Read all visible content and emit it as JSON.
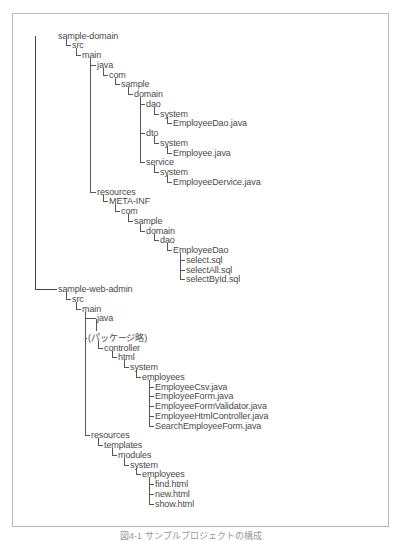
{
  "figure": {
    "caption": "図4-1 サンプルプロジェクトの構成",
    "row_height": 9.75,
    "top_y": 30.5
  },
  "tree": [
    {
      "label": "sample-domain",
      "x": 58,
      "row": 0
    },
    {
      "label": "src",
      "x": 72,
      "row": 1
    },
    {
      "label": "main",
      "x": 82,
      "row": 2
    },
    {
      "label": "java",
      "x": 97,
      "row": 3
    },
    {
      "label": "com",
      "x": 109,
      "row": 4
    },
    {
      "label": "sample",
      "x": 121,
      "row": 5
    },
    {
      "label": "domain",
      "x": 134,
      "row": 6
    },
    {
      "label": "dao",
      "x": 146,
      "row": 7
    },
    {
      "label": "system",
      "x": 160,
      "row": 8
    },
    {
      "label": "EmployeeDao.java",
      "x": 173,
      "row": 9
    },
    {
      "label": "dto",
      "x": 146,
      "row": 10
    },
    {
      "label": "system",
      "x": 160,
      "row": 11
    },
    {
      "label": "Employee.java",
      "x": 173,
      "row": 12
    },
    {
      "label": "service",
      "x": 146,
      "row": 13
    },
    {
      "label": "system",
      "x": 160,
      "row": 14
    },
    {
      "label": "EmployeeDervice.java",
      "x": 173,
      "row": 15
    },
    {
      "label": "resources",
      "x": 97,
      "row": 16
    },
    {
      "label": "META-INF",
      "x": 109,
      "row": 17
    },
    {
      "label": "com",
      "x": 121,
      "row": 18
    },
    {
      "label": "sample",
      "x": 134,
      "row": 19
    },
    {
      "label": "domain",
      "x": 146,
      "row": 20
    },
    {
      "label": "dao",
      "x": 160,
      "row": 21
    },
    {
      "label": "EmployeeDao",
      "x": 173,
      "row": 22
    },
    {
      "label": "select.sql",
      "x": 186,
      "row": 23
    },
    {
      "label": "selectAll.sql",
      "x": 186,
      "row": 24
    },
    {
      "label": "selectById.sql",
      "x": 186,
      "row": 25
    },
    {
      "label": "sample-web-admin",
      "x": 58,
      "row": 26
    },
    {
      "label": "src",
      "x": 72,
      "row": 27
    },
    {
      "label": "main",
      "x": 82,
      "row": 28
    },
    {
      "label": "java",
      "x": 97,
      "row": 29
    },
    {
      "label": "(パッケージ略)",
      "x": 88,
      "row": 31
    },
    {
      "label": "controller",
      "x": 104,
      "row": 32
    },
    {
      "label": "html",
      "x": 118,
      "row": 33
    },
    {
      "label": "system",
      "x": 130,
      "row": 34
    },
    {
      "label": "employees",
      "x": 142,
      "row": 35
    },
    {
      "label": "EmployeeCsv.java",
      "x": 155,
      "row": 36
    },
    {
      "label": "EmployeeForm.java",
      "x": 155,
      "row": 37
    },
    {
      "label": "EmployeeFormValidator.java",
      "x": 155,
      "row": 38
    },
    {
      "label": "EmployeeHtmlController.java",
      "x": 155,
      "row": 39
    },
    {
      "label": "SearchEmployeeForm.java",
      "x": 155,
      "row": 40
    },
    {
      "label": "resources",
      "x": 91,
      "row": 41
    },
    {
      "label": "templates",
      "x": 104,
      "row": 42
    },
    {
      "label": "modules",
      "x": 118,
      "row": 43
    },
    {
      "label": "system",
      "x": 130,
      "row": 44
    },
    {
      "label": "employees",
      "x": 142,
      "row": 45
    },
    {
      "label": "find.html",
      "x": 155,
      "row": 46
    },
    {
      "label": "new.html",
      "x": 155,
      "row": 47
    },
    {
      "label": "show.html",
      "x": 155,
      "row": 48
    }
  ],
  "connectors": {
    "vertical": [
      {
        "x": 35,
        "from": 0,
        "to": 26,
        "trunk": true
      },
      {
        "x": 66,
        "from": 0,
        "to": 1
      },
      {
        "x": 76,
        "from": 1,
        "to": 2
      },
      {
        "x": 90,
        "from": 2,
        "to": 16
      },
      {
        "x": 103,
        "from": 3,
        "to": 4
      },
      {
        "x": 115,
        "from": 4,
        "to": 5
      },
      {
        "x": 128,
        "from": 5,
        "to": 6
      },
      {
        "x": 140,
        "from": 6,
        "to": 13
      },
      {
        "x": 154,
        "from": 7,
        "to": 8
      },
      {
        "x": 167,
        "from": 8,
        "to": 9
      },
      {
        "x": 154,
        "from": 10,
        "to": 11
      },
      {
        "x": 167,
        "from": 11,
        "to": 12
      },
      {
        "x": 154,
        "from": 13,
        "to": 14
      },
      {
        "x": 167,
        "from": 14,
        "to": 15
      },
      {
        "x": 103,
        "from": 16,
        "to": 17
      },
      {
        "x": 115,
        "from": 17,
        "to": 18
      },
      {
        "x": 128,
        "from": 18,
        "to": 19
      },
      {
        "x": 140,
        "from": 19,
        "to": 20
      },
      {
        "x": 154,
        "from": 20,
        "to": 21
      },
      {
        "x": 167,
        "from": 21,
        "to": 22
      },
      {
        "x": 180,
        "from": 22,
        "to": 25
      },
      {
        "x": 66,
        "from": 26,
        "to": 27
      },
      {
        "x": 76,
        "from": 27,
        "to": 28
      },
      {
        "x": 85,
        "from": 28,
        "to": 41
      },
      {
        "x": 96,
        "from": 29.6,
        "to": 30.8
      },
      {
        "x": 98,
        "from": 31,
        "to": 32
      },
      {
        "x": 112,
        "from": 32,
        "to": 33
      },
      {
        "x": 124,
        "from": 33,
        "to": 34
      },
      {
        "x": 136,
        "from": 34,
        "to": 35
      },
      {
        "x": 149,
        "from": 35,
        "to": 40
      },
      {
        "x": 98,
        "from": 41,
        "to": 42
      },
      {
        "x": 112,
        "from": 42,
        "to": 43
      },
      {
        "x": 124,
        "from": 43,
        "to": 44
      },
      {
        "x": 136,
        "from": 44,
        "to": 45
      },
      {
        "x": 149,
        "from": 45,
        "to": 48
      }
    ]
  }
}
